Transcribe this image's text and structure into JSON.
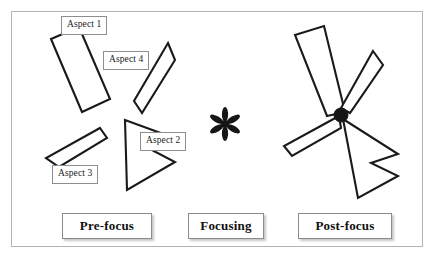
{
  "figure": {
    "border_color": "#b4b4b4",
    "shape_stroke_color": "#1a1a1a",
    "hub_color": "#161616"
  },
  "stages": [
    {
      "id": "pre-focus",
      "label": "Pre-focus"
    },
    {
      "id": "focusing",
      "label": "Focusing"
    },
    {
      "id": "post-focus",
      "label": "Post-focus"
    }
  ],
  "aspects": [
    {
      "id": "aspect-1",
      "label": "Aspect 1",
      "shape": "elongated-rectangle"
    },
    {
      "id": "aspect-4",
      "label": "Aspect 4",
      "shape": "narrow-wedge"
    },
    {
      "id": "aspect-2",
      "label": "Aspect 2",
      "shape": "dart-arrowhead"
    },
    {
      "id": "aspect-3",
      "label": "Aspect 3",
      "shape": "thin-parallelogram"
    }
  ],
  "focusing_symbol": {
    "name": "asterisk",
    "glyph": "*",
    "petals": 6,
    "color": "#161616"
  },
  "pre_focus_shapes": [
    {
      "id": "aspect-1",
      "points": "51,39 79,27 110,99 82,112"
    },
    {
      "id": "aspect-4",
      "points": "168,43 175,60 142,113 134,101"
    },
    {
      "id": "aspect-2",
      "points": "125,120 127,190 175,162 148,148 177,139"
    },
    {
      "id": "aspect-3",
      "points": "100,128 107,138 59,167 46,158"
    }
  ],
  "post_focus_shapes": [
    {
      "id": "aspect-1",
      "points": "295,35 324,26 345,112 327,116"
    },
    {
      "id": "aspect-4",
      "points": "373,51 383,65 350,113 341,108"
    },
    {
      "id": "aspect-2",
      "points": "343,119 358,198 398,176 371,163 398,154"
    },
    {
      "id": "aspect-3",
      "points": "339,116 341,128 292,156 284,146"
    }
  ],
  "hub": {
    "cx": 341,
    "cy": 115,
    "r": 7
  }
}
